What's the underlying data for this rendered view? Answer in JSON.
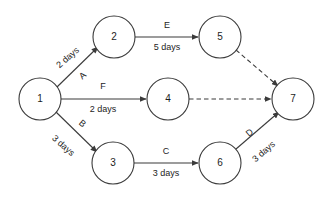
{
  "diagram": {
    "type": "activity-on-arrow-network-diagram",
    "background_color": "#ffffff",
    "line_color": "#3b3b3b",
    "text_color": "#1d1d1d",
    "nodes": [
      {
        "id": "n1",
        "label": "1",
        "cx": 40,
        "cy": 99,
        "r": 21
      },
      {
        "id": "n2",
        "label": "2",
        "cx": 114,
        "cy": 37,
        "r": 21
      },
      {
        "id": "n3",
        "label": "3",
        "cx": 113,
        "cy": 163,
        "r": 21
      },
      {
        "id": "n4",
        "label": "4",
        "cx": 168,
        "cy": 99,
        "r": 21
      },
      {
        "id": "n5",
        "label": "5",
        "cx": 220,
        "cy": 37,
        "r": 21
      },
      {
        "id": "n6",
        "label": "6",
        "cx": 220,
        "cy": 163,
        "r": 21
      },
      {
        "id": "n7",
        "label": "7",
        "cx": 293,
        "cy": 99,
        "r": 21
      }
    ],
    "edges": [
      {
        "id": "e-a",
        "from": "1",
        "to": "2",
        "style": "solid",
        "arrow": true,
        "activity": "A",
        "duration": "2 days",
        "x1": 57,
        "y1": 87,
        "x2": 98,
        "y2": 47,
        "duration_x": 68,
        "duration_y": 58,
        "duration_rotate": -41,
        "activity_x": 83,
        "activity_y": 76,
        "activity_rotate": -41
      },
      {
        "id": "e-b",
        "from": "1",
        "to": "3",
        "style": "solid",
        "arrow": true,
        "activity": "B",
        "duration": "3 days",
        "x1": 56,
        "y1": 112,
        "x2": 97,
        "y2": 152,
        "duration_x": 63,
        "duration_y": 146,
        "duration_rotate": 41,
        "activity_x": 82,
        "activity_y": 124,
        "activity_rotate": 41
      },
      {
        "id": "e-f",
        "from": "1",
        "to": "4",
        "style": "solid",
        "arrow": true,
        "activity": "F",
        "duration": "2 days",
        "x1": 61,
        "y1": 99,
        "x2": 146,
        "y2": 99,
        "activity_x": 103,
        "activity_y": 87,
        "activity_rotate": 0,
        "duration_x": 103,
        "duration_y": 110,
        "duration_rotate": 0
      },
      {
        "id": "e-e",
        "from": "2",
        "to": "5",
        "style": "solid",
        "arrow": true,
        "activity": "E",
        "duration": "5 days",
        "x1": 135,
        "y1": 37,
        "x2": 198,
        "y2": 37,
        "activity_x": 167,
        "activity_y": 26,
        "activity_rotate": 0,
        "duration_x": 167,
        "duration_y": 48,
        "duration_rotate": 0
      },
      {
        "id": "e-c",
        "from": "3",
        "to": "6",
        "style": "solid",
        "arrow": true,
        "activity": "C",
        "duration": "3 days",
        "x1": 134,
        "y1": 163,
        "x2": 198,
        "y2": 163,
        "activity_x": 166,
        "activity_y": 152,
        "activity_rotate": 0,
        "duration_x": 166,
        "duration_y": 174,
        "duration_rotate": 0
      },
      {
        "id": "e-d",
        "from": "6",
        "to": "7",
        "style": "solid",
        "arrow": true,
        "activity": "D",
        "duration": "3 days",
        "x1": 236,
        "y1": 149,
        "x2": 279,
        "y2": 112,
        "activity_x": 250,
        "activity_y": 133,
        "activity_rotate": -41,
        "duration_x": 264,
        "duration_y": 152,
        "duration_rotate": -41
      },
      {
        "id": "e-dummy-5-7",
        "from": "5",
        "to": "7",
        "style": "dashed",
        "arrow": true,
        "activity": "",
        "duration": "",
        "x1": 236,
        "y1": 50,
        "x2": 278,
        "y2": 86
      },
      {
        "id": "e-dummy-4-7",
        "from": "4",
        "to": "7",
        "style": "dashed",
        "arrow": true,
        "activity": "",
        "duration": "",
        "x1": 189,
        "y1": 99,
        "x2": 271,
        "y2": 99
      }
    ]
  }
}
